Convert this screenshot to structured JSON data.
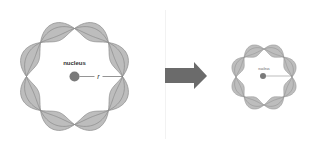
{
  "diagram": {
    "left_orbital": {
      "center": [
        74.5,
        76.5
      ],
      "node_radius": 48,
      "amplitude": 9,
      "lobes": 8,
      "nucleus_label": "nucleus",
      "radius_label": "r"
    },
    "arrow": {
      "direction": "right",
      "color": "#6b6b6b"
    },
    "right_orbital": {
      "center": [
        264,
        77
      ],
      "node_radius": 28,
      "amplitude": 6,
      "lobes": 8,
      "nucleus_label": "nucleus",
      "radius_label": "r"
    },
    "colors": {
      "lobe_fill": "#bdbdbd",
      "lobe_stroke": "#8a8a8a",
      "nucleus": "#7a7a7a",
      "label": "#333333"
    }
  }
}
